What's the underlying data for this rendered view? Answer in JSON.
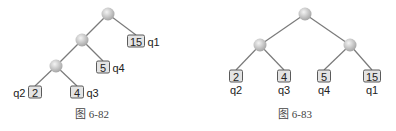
{
  "figures": [
    {
      "caption": "图 6-82",
      "internal_nodes": [
        {
          "id": "r",
          "x": 108,
          "y": 14
        },
        {
          "id": "m",
          "x": 82,
          "y": 40
        },
        {
          "id": "l",
          "x": 56,
          "y": 66
        }
      ],
      "leaves": [
        {
          "value": "15",
          "label": "q1",
          "x": 136,
          "y": 41,
          "label_side": "right",
          "parent": "r"
        },
        {
          "value": "5",
          "label": "q4",
          "x": 103,
          "y": 67,
          "label_side": "right",
          "parent": "m"
        },
        {
          "value": "2",
          "label": "q2",
          "x": 35,
          "y": 92,
          "label_side": "left",
          "parent": "l"
        },
        {
          "value": "4",
          "label": "q3",
          "x": 77,
          "y": 92,
          "label_side": "right",
          "parent": "l"
        }
      ],
      "edges": [
        [
          "r",
          "m"
        ],
        [
          "m",
          "l"
        ]
      ],
      "caption_x": 92,
      "caption_y": 118
    },
    {
      "caption": "图 6-83",
      "internal_nodes": [
        {
          "id": "r",
          "x": 305,
          "y": 14
        },
        {
          "id": "a",
          "x": 260,
          "y": 45
        },
        {
          "id": "b",
          "x": 350,
          "y": 45
        }
      ],
      "leaves": [
        {
          "value": "2",
          "label": "q2",
          "x": 236,
          "y": 76,
          "label_side": "below",
          "parent": "a"
        },
        {
          "value": "4",
          "label": "q3",
          "x": 284,
          "y": 76,
          "label_side": "below",
          "parent": "a"
        },
        {
          "value": "5",
          "label": "q4",
          "x": 324,
          "y": 76,
          "label_side": "below",
          "parent": "b"
        },
        {
          "value": "15",
          "label": "q1",
          "x": 372,
          "y": 76,
          "label_side": "below",
          "parent": "b"
        }
      ],
      "edges": [
        [
          "r",
          "a"
        ],
        [
          "r",
          "b"
        ]
      ],
      "caption_x": 295,
      "caption_y": 118
    }
  ],
  "colors": {
    "node_light": "#f2f2f2",
    "node_dark": "#a8a8a8",
    "edge": "#7a7a7a",
    "leaf_fill": "#e4e4e4",
    "leaf_border": "#5a5a5a"
  }
}
